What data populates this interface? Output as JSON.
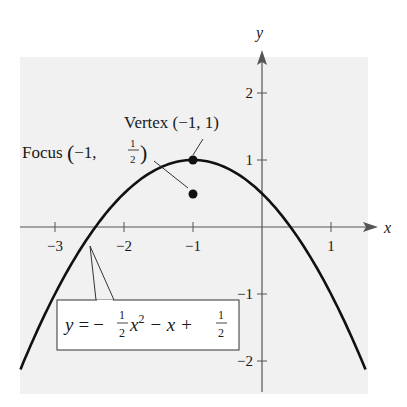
{
  "chart_data": {
    "type": "line",
    "title": "",
    "equation": "y = -1/2 x^2 - x + 1/2",
    "equation_label": {
      "lhs": "y",
      "eq": "=",
      "minus": "−",
      "frac_num": "1",
      "frac_den": "2",
      "x2": "x",
      "exp": "2",
      "rest": " − x + ",
      "frac2_num": "1",
      "frac2_den": "2"
    },
    "xlabel": "x",
    "ylabel": "y",
    "xlim": [
      -3.6,
      1.6
    ],
    "ylim": [
      -2.4,
      2.6
    ],
    "xticks": [
      -3,
      -2,
      -1,
      1
    ],
    "xtick_labels": [
      "−3",
      "−2",
      "−1",
      "1"
    ],
    "yticks": [
      2,
      1,
      -1,
      -2
    ],
    "ytick_labels": [
      "2",
      "1",
      "−1",
      "−2"
    ],
    "grid": false,
    "series": [
      {
        "name": "parabola",
        "x_range": [
          -3.5,
          1.5
        ],
        "formula": "-0.5*x*x - x + 0.5"
      }
    ],
    "points": [
      {
        "name": "Vertex",
        "x": -1,
        "y": 1
      },
      {
        "name": "Focus",
        "x": -1,
        "y": 0.5
      }
    ],
    "annotations": {
      "vertex": {
        "text": "Vertex (−1, 1)"
      },
      "focus": {
        "prefix": "Focus ",
        "open": "(",
        "coord": "−1, ",
        "num": "1",
        "den": "2",
        "close": ")"
      }
    }
  },
  "colors": {
    "curve": "#111111",
    "axis": "#555555",
    "background": "#f1f1f1",
    "box": "#ffffff"
  }
}
